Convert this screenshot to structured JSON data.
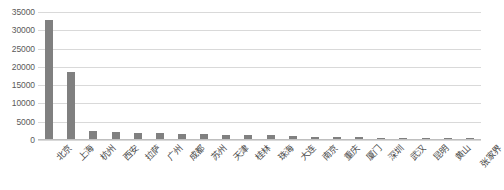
{
  "chart_data": {
    "type": "bar",
    "title": "",
    "xlabel": "",
    "ylabel": "",
    "ylim": [
      0,
      35000
    ],
    "ytick_step": 5000,
    "yticks": [
      "35000",
      "30000",
      "25000",
      "20000",
      "15000",
      "10000",
      "5000",
      "0"
    ],
    "grid": true,
    "legend": "none",
    "orientation": "vertical",
    "bar_color": "#808080",
    "gridline_color": "#d9d9d9",
    "axis_text_color": "#5a5a5a",
    "background_color": "#ffffff",
    "xtick_rotation": -45,
    "categories": [
      "北京",
      "上海",
      "杭州",
      "西安",
      "拉萨",
      "广州",
      "成都",
      "苏州",
      "天津",
      "桂林",
      "珠海",
      "大连",
      "南京",
      "重庆",
      "厦门",
      "深圳",
      "武汉",
      "昆明",
      "黄山",
      "张家界"
    ],
    "values": [
      32700,
      18600,
      2500,
      2100,
      1900,
      1800,
      1750,
      1600,
      1500,
      1400,
      1250,
      1100,
      950,
      800,
      700,
      650,
      600,
      550,
      480,
      420
    ],
    "series": [
      {
        "name": "数量",
        "values": [
          32700,
          18600,
          2500,
          2100,
          1900,
          1800,
          1750,
          1600,
          1500,
          1400,
          1250,
          1100,
          950,
          800,
          700,
          650,
          600,
          550,
          480,
          420
        ]
      }
    ]
  }
}
